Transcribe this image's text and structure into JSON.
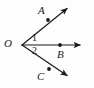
{
  "figure": {
    "type": "geometry-diagram",
    "background_color": "#fdfdfd",
    "stroke_color": "#1a1a1a",
    "stroke_width": 1.2,
    "vertex": {
      "name": "O",
      "label": "O",
      "x": 22,
      "y": 45
    },
    "points": [
      {
        "name": "A",
        "label": "A",
        "dot_x": 48,
        "dot_y": 20,
        "label_x": 38,
        "label_y": 5
      },
      {
        "name": "B",
        "label": "B",
        "dot_x": 60,
        "dot_y": 45,
        "label_x": 57,
        "label_y": 49
      },
      {
        "name": "C",
        "label": "C",
        "dot_x": 49,
        "dot_y": 69,
        "label_x": 37,
        "label_y": 71
      }
    ],
    "rays": [
      {
        "name": "ray-OA",
        "from": "O",
        "through": "A",
        "x1": 22,
        "y1": 45,
        "x2": 70,
        "y2": 6,
        "arrow": true
      },
      {
        "name": "ray-OB",
        "from": "O",
        "through": "B",
        "x1": 22,
        "y1": 45,
        "x2": 84,
        "y2": 45,
        "arrow": true
      },
      {
        "name": "ray-OC",
        "from": "O",
        "through": "C",
        "x1": 22,
        "y1": 45,
        "x2": 70,
        "y2": 78,
        "arrow": true
      }
    ],
    "angles": [
      {
        "name": "angle-1",
        "label": "1",
        "between": "ray-OA and ray-OB",
        "label_x": 32,
        "label_y": 33
      },
      {
        "name": "angle-2",
        "label": "2",
        "between": "ray-OB and ray-OC",
        "label_x": 32,
        "label_y": 46
      }
    ]
  }
}
